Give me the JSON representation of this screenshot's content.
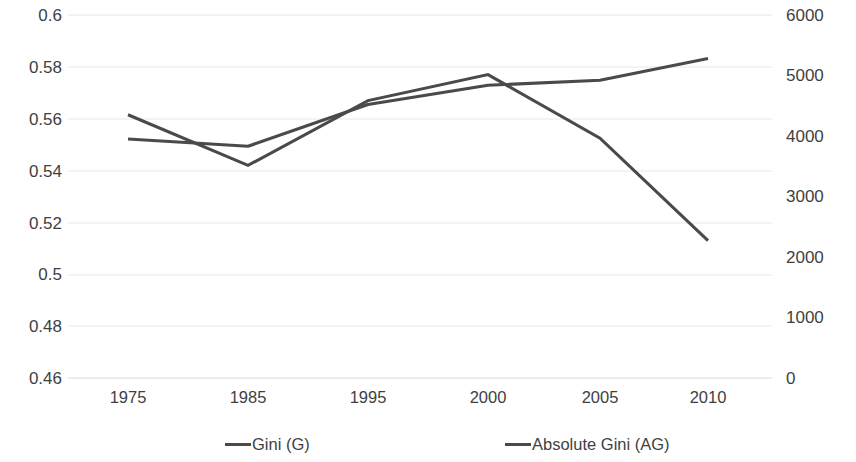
{
  "chart_data": {
    "type": "line",
    "title": "",
    "subtitle": "",
    "xlabel": "",
    "ylabel": "",
    "y2label": "",
    "categories": [
      "1975",
      "1985",
      "1995",
      "2000",
      "2005",
      "2010"
    ],
    "grid": true,
    "legend_position": "bottom",
    "axes": {
      "left": {
        "ticks": [
          "0.6",
          "0.58",
          "0.56",
          "0.54",
          "0.52",
          "0.5",
          "0.48",
          "0.46"
        ],
        "tick_values": [
          0.6,
          0.58,
          0.56,
          0.54,
          0.52,
          0.5,
          0.48,
          0.46
        ],
        "min": 0.46,
        "max": 0.6
      },
      "right": {
        "ticks": [
          "6000",
          "5000",
          "4000",
          "3000",
          "2000",
          "1000",
          "0"
        ],
        "tick_values": [
          6000,
          5000,
          4000,
          3000,
          2000,
          1000,
          0
        ],
        "min": 0,
        "max": 6000
      }
    },
    "series": [
      {
        "name": "Gini (G)",
        "axis": "left",
        "color": "#4a4a4a",
        "values": [
          0.5615,
          0.542,
          0.567,
          0.577,
          0.5525,
          0.513
        ]
      },
      {
        "name": "Absolute Gini (AG)",
        "axis": "right",
        "color": "#4a4a4a",
        "values": [
          3950,
          3830,
          4520,
          4840,
          4920,
          5280
        ]
      }
    ]
  },
  "legend": {
    "items": [
      {
        "label": "Gini (G)"
      },
      {
        "label": "Absolute Gini (AG)"
      }
    ]
  }
}
